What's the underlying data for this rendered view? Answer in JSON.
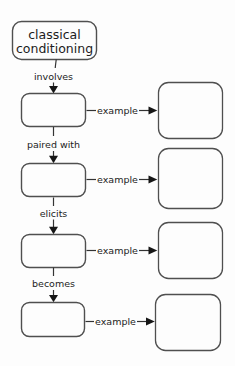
{
  "diagram": {
    "title": {
      "text": "classical conditioning",
      "lines": [
        "classical",
        "conditioning"
      ]
    },
    "connectors": [
      {
        "label": "involves"
      },
      {
        "label": "paired with"
      },
      {
        "label": "elicits"
      },
      {
        "label": "becomes"
      }
    ],
    "examples": [
      {
        "label": "example"
      },
      {
        "label": "example"
      },
      {
        "label": "example"
      },
      {
        "label": "example"
      }
    ],
    "left_boxes": [
      {
        "value": ""
      },
      {
        "value": ""
      },
      {
        "value": ""
      },
      {
        "value": ""
      }
    ],
    "right_boxes": [
      {
        "value": ""
      },
      {
        "value": ""
      },
      {
        "value": ""
      },
      {
        "value": ""
      }
    ],
    "colors": {
      "background": "#fdfdfd",
      "box_border": "#4f4f4f",
      "connector_line": "#333333",
      "arrowhead": "#161616",
      "text": "#1c1c1c"
    }
  }
}
